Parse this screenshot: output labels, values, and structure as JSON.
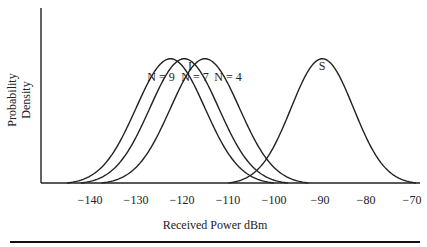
{
  "chart_data": {
    "type": "line",
    "title": "",
    "xlabel": "Received Power dBm",
    "ylabel": "Probability Density",
    "xlim": [
      -148,
      -68
    ],
    "ylim": [
      0,
      1
    ],
    "x_ticks": [
      -140,
      -130,
      -120,
      -110,
      -100,
      -90,
      -80,
      -70
    ],
    "x_tick_labels": [
      "−140",
      "−130",
      "−120",
      "−110",
      "−100",
      "−90",
      "−80",
      "−70"
    ],
    "grid": false,
    "series": [
      {
        "name": "N = 9",
        "group": "I",
        "mean": -122.5,
        "sigma": 7.5,
        "peak": 0.71
      },
      {
        "name": "N = 7",
        "group": "I",
        "mean": -119.5,
        "sigma": 7.5,
        "peak": 0.71
      },
      {
        "name": "N = 4",
        "group": "I",
        "mean": -115,
        "sigma": 7.5,
        "peak": 0.71
      },
      {
        "name": "S",
        "group": "S",
        "mean": -89.5,
        "sigma": 6.8,
        "peak": 0.71
      }
    ],
    "annotations": [
      {
        "text": "I",
        "near": "interference curves"
      },
      {
        "text": "N = 9",
        "near": "leftmost I curve"
      },
      {
        "text": "N = 7",
        "near": "middle I curve"
      },
      {
        "text": "N = 4",
        "near": "rightmost I curve"
      },
      {
        "text": "S",
        "near": "signal curve"
      }
    ]
  }
}
